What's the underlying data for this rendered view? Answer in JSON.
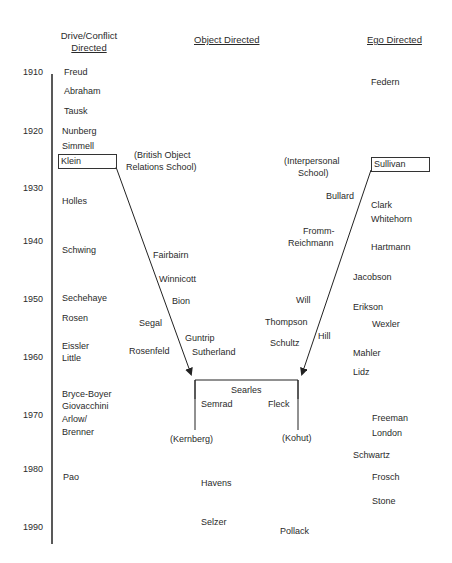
{
  "headers": {
    "drive": {
      "line1": "Drive/Conflict",
      "line2": "Directed"
    },
    "object": "Object Directed",
    "ego": "Ego Directed"
  },
  "years": [
    "1910",
    "1920",
    "1930",
    "1940",
    "1950",
    "1960",
    "1970",
    "1980",
    "1990"
  ],
  "drive_names": [
    "Freud",
    "Abraham",
    "Tausk",
    "Nunberg",
    "Simmell",
    "Klein",
    "Holles",
    "Schwing",
    "Sechehaye",
    "Rosen",
    "Eissler",
    "Little",
    "Bryce-Boyer",
    "Giovacchini",
    "Arlow/",
    "Brenner",
    "Pao"
  ],
  "object_names": [
    "(British Object",
    "Relations School)",
    "Fairbairn",
    "Winnicott",
    "Bion",
    "Segal",
    "Guntrip",
    "Rosenfeld",
    "Sutherland"
  ],
  "interpersonal_names": [
    "(Interpersonal",
    "School)",
    "Bullard",
    "Fromm-",
    "Reichmann",
    "Will",
    "Thompson",
    "Hill",
    "Schultz"
  ],
  "ego_names": [
    "Federn",
    "Sullivan",
    "Clark",
    "Whitehorn",
    "Hartmann",
    "Jacobson",
    "Erikson",
    "Wexler",
    "Mahler",
    "Lidz",
    "Freeman",
    "London",
    "Schwartz",
    "Frosch",
    "Stone"
  ],
  "convergence": [
    "Searles",
    "Semrad",
    "Fleck",
    "(Kernberg)",
    "(Kohut)"
  ],
  "later_names": [
    "Havens",
    "Selzer",
    "Pollack"
  ]
}
